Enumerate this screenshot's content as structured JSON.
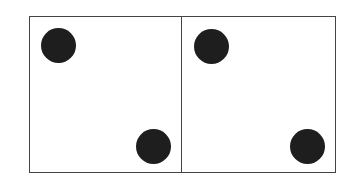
{
  "diagram": {
    "panels": [
      {
        "label": "",
        "dots": [
          {
            "cx": 58,
            "cy": 45
          },
          {
            "cx": 153,
            "cy": 146
          }
        ]
      },
      {
        "label": "",
        "dots": [
          {
            "cx": 211,
            "cy": 46
          },
          {
            "cx": 307,
            "cy": 146
          }
        ]
      }
    ],
    "colors": {
      "border": "#444444",
      "dot": "#1e1e1e",
      "background": "#ffffff"
    }
  }
}
